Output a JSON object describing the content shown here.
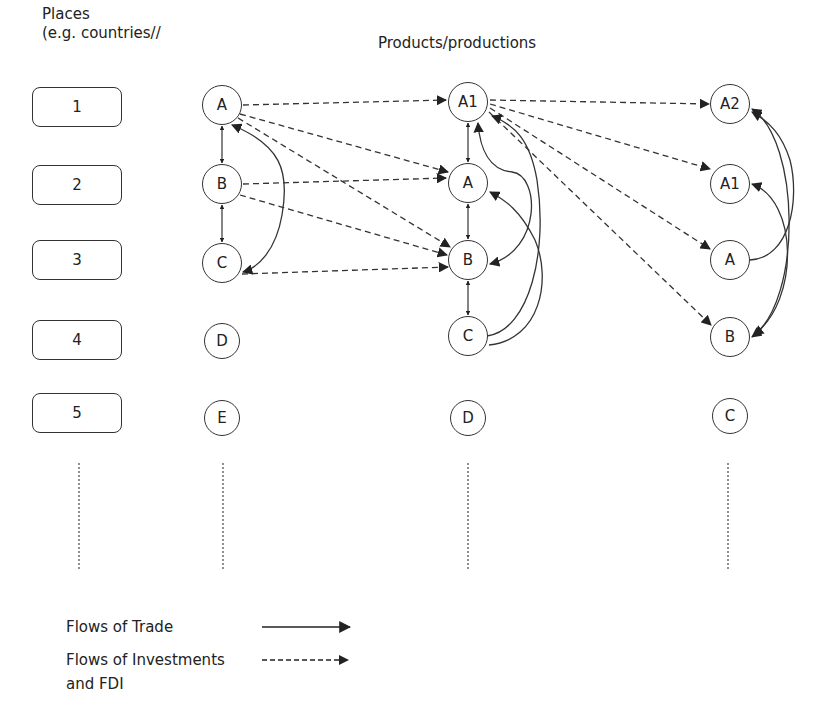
{
  "headers": {
    "places_line1": "Places",
    "places_line2": "(e.g. countries//",
    "products": "Products/productions"
  },
  "places": [
    {
      "label": "1"
    },
    {
      "label": "2"
    },
    {
      "label": "3"
    },
    {
      "label": "4"
    },
    {
      "label": "5"
    }
  ],
  "columns": [
    {
      "nodes": [
        {
          "label": "A"
        },
        {
          "label": "B"
        },
        {
          "label": "C"
        },
        {
          "label": "D"
        },
        {
          "label": "E"
        }
      ]
    },
    {
      "nodes": [
        {
          "label": "A1"
        },
        {
          "label": "A"
        },
        {
          "label": "B"
        },
        {
          "label": "C"
        },
        {
          "label": "D"
        }
      ]
    },
    {
      "nodes": [
        {
          "label": "A2"
        },
        {
          "label": "A1"
        },
        {
          "label": "A"
        },
        {
          "label": "B"
        },
        {
          "label": "C"
        }
      ]
    }
  ],
  "legend": {
    "trade_label": "Flows of Trade",
    "investment_label_line1": "Flows of Investments",
    "investment_label_line2": "and FDI"
  },
  "edges": {
    "investment_dashed": [
      "col1.A -> col2.A1",
      "col1.A -> col2.A",
      "col1.A -> col2.B",
      "col1.B -> col2.A",
      "col1.B -> col2.B",
      "col1.C -> col2.B",
      "col2.A1 -> col3.A2",
      "col2.A1 -> col3.A1",
      "col2.A1 -> col3.A",
      "col2.A1 -> col3.B"
    ],
    "trade_solid": [
      "col1.A <-> col1.B",
      "col1.B <-> col1.C",
      "col1.A <-> col1.C",
      "col2.A1 <-> col2.A",
      "col2.A <-> col2.B",
      "col2.B <-> col2.C",
      "col2.A1 <-> col2.B",
      "col2.C -> col2.A1",
      "col2.C -> col2.A",
      "col3.A -> col3.A2",
      "col3.A2 <-> col3.B",
      "col3.A1 <-> col3.B"
    ]
  }
}
